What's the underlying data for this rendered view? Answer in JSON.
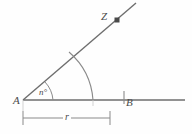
{
  "diagram": {
    "kind": "geometry-angle-diagram",
    "background_color": "#fefefe",
    "stroke_color": "#6e6e6e",
    "label_color": "#4a4a4a",
    "labels": {
      "vertex": "A",
      "base_point": "B",
      "ray_point": "Z",
      "angle": "n°",
      "radius": "r"
    },
    "points": {
      "A": {
        "x": 23,
        "y": 100
      },
      "B": {
        "x": 124,
        "y": 100
      },
      "Z_marker": {
        "x": 117,
        "y": 20
      },
      "ray_end": {
        "x": 136,
        "y": 3
      },
      "baseline_end": {
        "x": 185,
        "y": 100
      },
      "arc_on_ray": {
        "x": 72,
        "y": 55
      },
      "arc_on_base": {
        "x": 93,
        "y": 100
      }
    },
    "elements": {
      "ray_AZ": "ray from A through Z",
      "ray_AB": "horizontal ray from A through B",
      "angle_arc": "small arc marking angle n° at A",
      "construction_arc": "large arc of radius r centered at A",
      "z_point_marker": "filled square point marker at Z",
      "b_tick": "vertical tick mark at B",
      "dimension_line": "dimension line labeled r from A to arc intersection"
    },
    "dimension": {
      "from_x": 23,
      "to_x": 110,
      "y": 118,
      "label": "r"
    }
  }
}
